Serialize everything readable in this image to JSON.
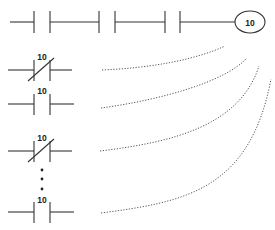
{
  "diagram": {
    "type": "ladder-logic",
    "top_rung": {
      "contacts": [
        {
          "type": "normally-open",
          "label": ""
        },
        {
          "type": "normally-open",
          "label": ""
        },
        {
          "type": "normally-open",
          "label": ""
        },
        {
          "type": "normally-open",
          "label": ""
        }
      ],
      "coil": {
        "label": "10"
      }
    },
    "contact_list": [
      {
        "type": "normally-closed",
        "label": "10"
      },
      {
        "type": "normally-open",
        "label": "10"
      },
      {
        "type": "normally-closed",
        "label": "10"
      },
      {
        "type": "ellipsis",
        "label": ""
      },
      {
        "type": "normally-open",
        "label": "10"
      }
    ],
    "connectors": {
      "style": "dotted",
      "count": 4
    },
    "colors": {
      "line": "#333333",
      "dotted": "#555555",
      "background": "#ffffff"
    }
  }
}
